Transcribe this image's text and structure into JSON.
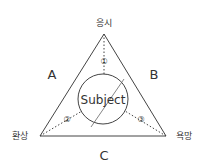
{
  "diagram": {
    "vertices": {
      "top": "응시",
      "left": "환상",
      "right": "욕망"
    },
    "sides": {
      "left": "A",
      "right": "B",
      "bottom": "C"
    },
    "center_label": "Subject",
    "markers": [
      "①",
      "②",
      "③"
    ],
    "colors": {
      "line": "#444444",
      "text": "#333333",
      "background": "#ffffff"
    }
  }
}
